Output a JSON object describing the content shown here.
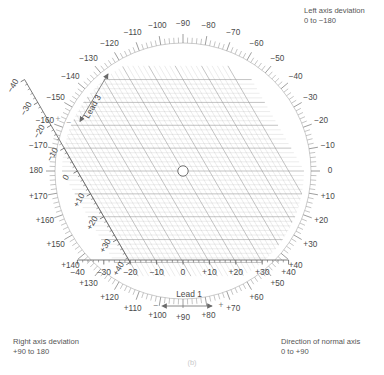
{
  "figure": {
    "caption": "(b)",
    "type": "hexaxial-reference-axis-diagram"
  },
  "notes": {
    "left_axis_deviation": "Left axis deviation\n0 to −180",
    "right_axis_deviation": "Right axis deviation\n+90 to 180",
    "normal_axis_direction": "Direction of normal axis\n0 to +90"
  },
  "lead1": {
    "label": "Lead 1",
    "negative_sign": "−",
    "positive_sign": "+",
    "tick_labels": [
      "−40",
      "−30",
      "−20",
      "−10",
      "0",
      "+10",
      "+20",
      "+30",
      "+40"
    ],
    "tick_values": [
      -40,
      -30,
      -20,
      -10,
      0,
      10,
      20,
      30,
      40
    ]
  },
  "lead3": {
    "label": "Lead 3",
    "negative_sign": "−",
    "positive_sign": "+",
    "tick_labels": [
      "−40",
      "−30",
      "−20",
      "−10",
      "0",
      "+10",
      "+20",
      "+30",
      "+40"
    ],
    "tick_values": [
      -40,
      -30,
      -20,
      -10,
      0,
      10,
      20,
      30,
      40
    ]
  },
  "degree_scale": {
    "negative_labels": [
      "−10",
      "−20",
      "−30",
      "−40",
      "−50",
      "−60",
      "−70",
      "−80",
      "−90",
      "−100",
      "−110",
      "−120",
      "−130",
      "−140",
      "−150",
      "−160",
      "−170"
    ],
    "zero_label": "0",
    "one_eighty_label": "180",
    "positive_labels": [
      "+10",
      "+20",
      "+30",
      "+40",
      "+50",
      "+60",
      "+70",
      "+80",
      "+90",
      "+100",
      "+110",
      "+120",
      "+130",
      "+140",
      "+150",
      "+160",
      "+170"
    ],
    "minor_tick_step_degrees": 2,
    "major_tick_step_degrees": 10
  },
  "center_marker": {
    "name": "origin-circle",
    "cx": 183,
    "cy": 171,
    "r": 5.2
  },
  "chart_data": {
    "type": "scatter",
    "title": "",
    "xlabel": "Lead 1",
    "ylabel": "Lead 3",
    "xlim": [
      -40,
      40
    ],
    "ylim": [
      -40,
      40
    ],
    "grid": true,
    "lead3_axis_angle_deg": 60,
    "annotations": [
      "Left axis deviation 0 to −180",
      "Right axis deviation +90 to 180",
      "Direction of normal axis 0 to +90"
    ],
    "points": [
      {
        "x": 0,
        "y": 0,
        "marker": "open-circle"
      }
    ]
  },
  "colors": {
    "grid": "#8d8d8d",
    "axis": "#5b5b5b",
    "text": "#4a4a4a",
    "faint": "#b8b8b8"
  }
}
